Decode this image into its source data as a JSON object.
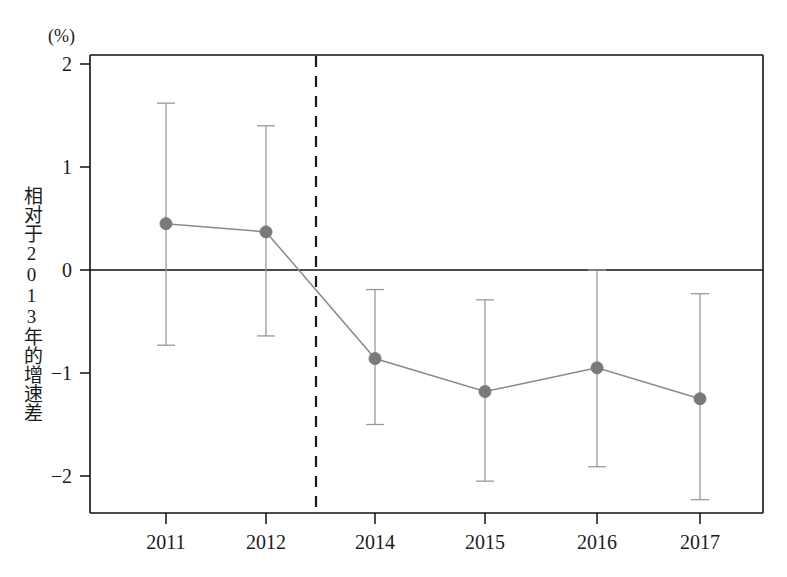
{
  "chart_data": {
    "type": "line",
    "title": "",
    "subtitle": "",
    "xlabel": "",
    "ylabel": "相对于2013年的增速差",
    "unit_label": "(%)",
    "categories": [
      "2011",
      "2012",
      "2014",
      "2015",
      "2016",
      "2017"
    ],
    "series": [
      {
        "name": "相对于2013年的增速差",
        "values": [
          0.45,
          0.37,
          -0.86,
          -1.18,
          -0.95,
          -1.25
        ],
        "error_upper": [
          1.62,
          1.4,
          -0.19,
          -0.29,
          0.0,
          -0.23
        ],
        "error_lower": [
          -0.73,
          -0.64,
          -1.5,
          -2.05,
          -1.91,
          -2.23
        ]
      }
    ],
    "ylim": [
      -2.4,
      2.15
    ],
    "yticks": [
      2,
      1,
      0,
      -1,
      -2
    ],
    "ytick_labels": [
      "2",
      "1",
      "0",
      "−1",
      "−2"
    ],
    "grid": false,
    "legend_position": "none",
    "reference_line_y": 0,
    "vertical_divider_label": "2013",
    "colors": {
      "marker": "#7a7a7a",
      "line": "#8a8a8a",
      "errorbar": "#9a9a9a",
      "axis": "#111111",
      "zero_line": "#111111",
      "divider": "#1a1a1a",
      "background": "#ffffff"
    }
  }
}
